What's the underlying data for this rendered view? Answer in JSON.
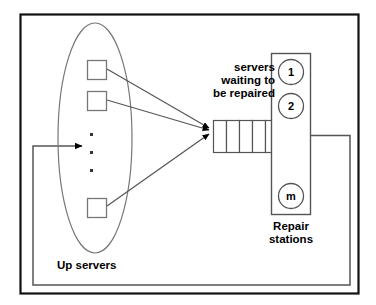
{
  "diagram": {
    "colors": {
      "line": "#555555",
      "border": "#111111",
      "text": "#000000",
      "background": "#ffffff"
    },
    "labels": {
      "queue_line1": "servers",
      "queue_line2": "waiting to",
      "queue_line3": "be repaired",
      "repair_line1": "Repair",
      "repair_line2": "stations",
      "up_servers": "Up servers"
    },
    "up_servers_group": {
      "name": "Up servers",
      "shape": "ellipse",
      "server_count_shown": 3,
      "continuation_dots": 3,
      "servers": [
        {
          "id": "server-1"
        },
        {
          "id": "server-2"
        },
        {
          "id": "server-3"
        }
      ]
    },
    "queue": {
      "name": "servers waiting to be repaired",
      "cells": 5,
      "cell_labels": [
        "",
        "",
        "",
        "",
        ""
      ],
      "incoming_arrows": 3
    },
    "repair_stations": {
      "name": "Repair stations",
      "count_label": "m",
      "stations": [
        {
          "label": "1"
        },
        {
          "label": "2"
        },
        {
          "label": "m"
        }
      ]
    },
    "feedback_loop": {
      "description": "repaired servers return to up servers",
      "arrowheads": 1
    }
  }
}
